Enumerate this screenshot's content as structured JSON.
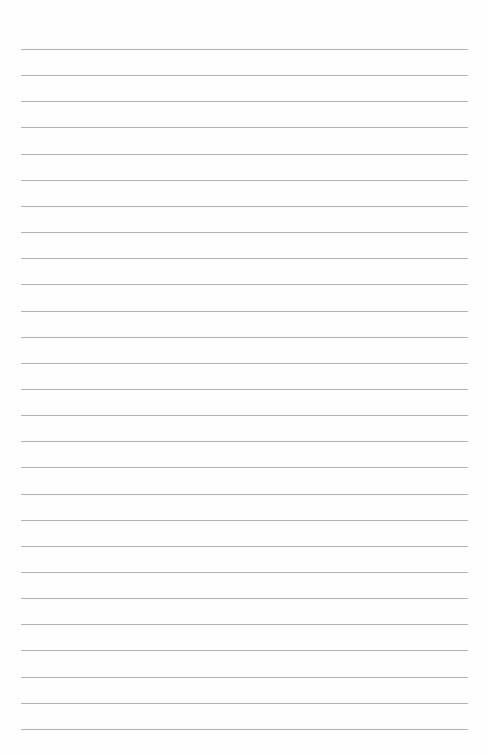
{
  "page": {
    "type": "lined-paper",
    "background": "#fefefe",
    "rule_color": "#9a9a9a",
    "rule_count": 27,
    "rule_first_y": 49,
    "rule_spacing": 26.15,
    "rule_left": 21,
    "rule_width": 447
  }
}
